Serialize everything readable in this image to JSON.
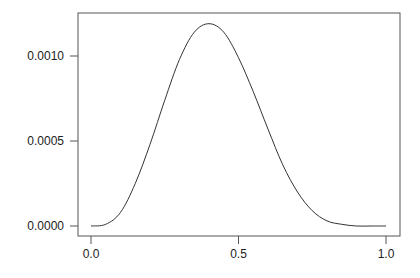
{
  "chart_data": {
    "type": "line",
    "title": "",
    "xlabel": "",
    "ylabel": "",
    "xlim": [
      0.0,
      1.0
    ],
    "ylim": [
      0.0,
      0.0012
    ],
    "x_ticks": [
      "0.0",
      "0.5",
      "1.0"
    ],
    "y_ticks": [
      "0.0000",
      "0.0005",
      "0.0010"
    ],
    "grid": false,
    "legend": null,
    "series": [
      {
        "name": "density",
        "x": [
          0.0,
          0.05,
          0.1,
          0.15,
          0.2,
          0.25,
          0.3,
          0.35,
          0.4,
          0.45,
          0.5,
          0.55,
          0.6,
          0.65,
          0.7,
          0.75,
          0.8,
          0.85,
          0.9,
          0.95,
          1.0
        ],
        "y": [
          0.0,
          1e-05,
          8e-05,
          0.00025,
          0.00048,
          0.00074,
          0.00098,
          0.00114,
          0.00119,
          0.00114,
          0.00099,
          0.00079,
          0.00057,
          0.00036,
          0.0002,
          9e-05,
          3e-05,
          1e-05,
          0.0,
          0.0,
          0.0
        ]
      }
    ]
  },
  "axes": {
    "x_tick_labels": [
      "0.0",
      "0.5",
      "1.0"
    ],
    "y_tick_labels": [
      "0.0000",
      "0.0005",
      "0.0010"
    ]
  },
  "colors": {
    "line": "#333333",
    "axis": "#555555"
  }
}
